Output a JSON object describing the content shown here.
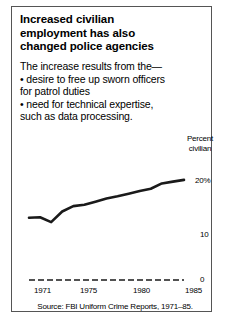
{
  "figure": {
    "title_lines": [
      "Increased civilian",
      "employment has also",
      "changed police agencies"
    ],
    "body_lines": [
      "The increase results from the—",
      "• desire to free up sworn officers",
      "for patrol duties",
      "• need for technical expertise,",
      "such as data processing."
    ],
    "source": "Source: FBI Uniform Crime Reports, 1971–85.",
    "border_color": "#555555",
    "line_color": "#1a1a1a"
  },
  "chart_data": {
    "type": "line",
    "title": "Increased civilian employment has also changed police agencies",
    "xlabel": "",
    "ylabel": "Percent civilian",
    "ylabel_lines": [
      "Percent",
      "civilian"
    ],
    "x": [
      1971,
      1972,
      1973,
      1974,
      1975,
      1976,
      1977,
      1978,
      1979,
      1980,
      1981,
      1982,
      1983,
      1984,
      1985
    ],
    "values": [
      14.0,
      14.1,
      13.0,
      15.4,
      16.6,
      16.9,
      17.6,
      18.3,
      18.8,
      19.4,
      20.0,
      20.5,
      21.7,
      22.1,
      22.5
    ],
    "series": [
      {
        "name": "Percent civilian",
        "values": [
          14.0,
          14.1,
          13.0,
          15.4,
          16.6,
          16.9,
          17.6,
          18.3,
          18.8,
          19.4,
          20.0,
          20.5,
          21.7,
          22.1,
          22.5
        ]
      }
    ],
    "x_ticks": [
      "1971",
      "1975",
      "1980",
      "1985"
    ],
    "x_tick_values": [
      1971,
      1975,
      1980,
      1985
    ],
    "y_ticks": [
      "0",
      "10",
      "20%"
    ],
    "y_tick_values": [
      0,
      10,
      20
    ],
    "xlim": [
      1971,
      1985
    ],
    "ylim": [
      0,
      25
    ],
    "grid": false,
    "legend": "none",
    "baseline_style": "dashed",
    "source": "Source: FBI Uniform Crime Reports, 1971–85."
  }
}
